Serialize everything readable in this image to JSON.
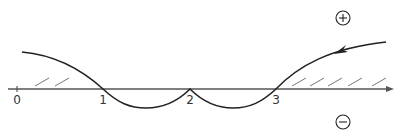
{
  "diagram": {
    "axis": {
      "tick_labels": [
        "0",
        "1",
        "2",
        "3"
      ],
      "color": "#555555"
    },
    "curve": {
      "color": "#222222",
      "direction": "right-to-left"
    },
    "regions": {
      "positive_symbol": "+",
      "negative_symbol": "−",
      "hatch_color": "#777777"
    }
  }
}
